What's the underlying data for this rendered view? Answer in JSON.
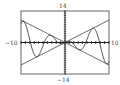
{
  "chart_data": {
    "type": "line",
    "title": "",
    "xlabel": "",
    "ylabel": "",
    "xlim": [
      -10,
      10
    ],
    "ylim": [
      -14,
      14
    ],
    "x_tick_step": 1,
    "y_tick_step": 1,
    "grid": false,
    "labels": {
      "ymax": "14",
      "ymin": "−14",
      "xmin": "−10",
      "xmax": "10"
    },
    "series": [
      {
        "name": "y = x",
        "expr": "x"
      },
      {
        "name": "y = -x",
        "expr": "-x"
      },
      {
        "name": "y = x cos x",
        "expr": "x*cos(x)"
      }
    ]
  },
  "colors": {
    "curve": "#333333",
    "frame": "#555555",
    "axis": "#222222"
  }
}
